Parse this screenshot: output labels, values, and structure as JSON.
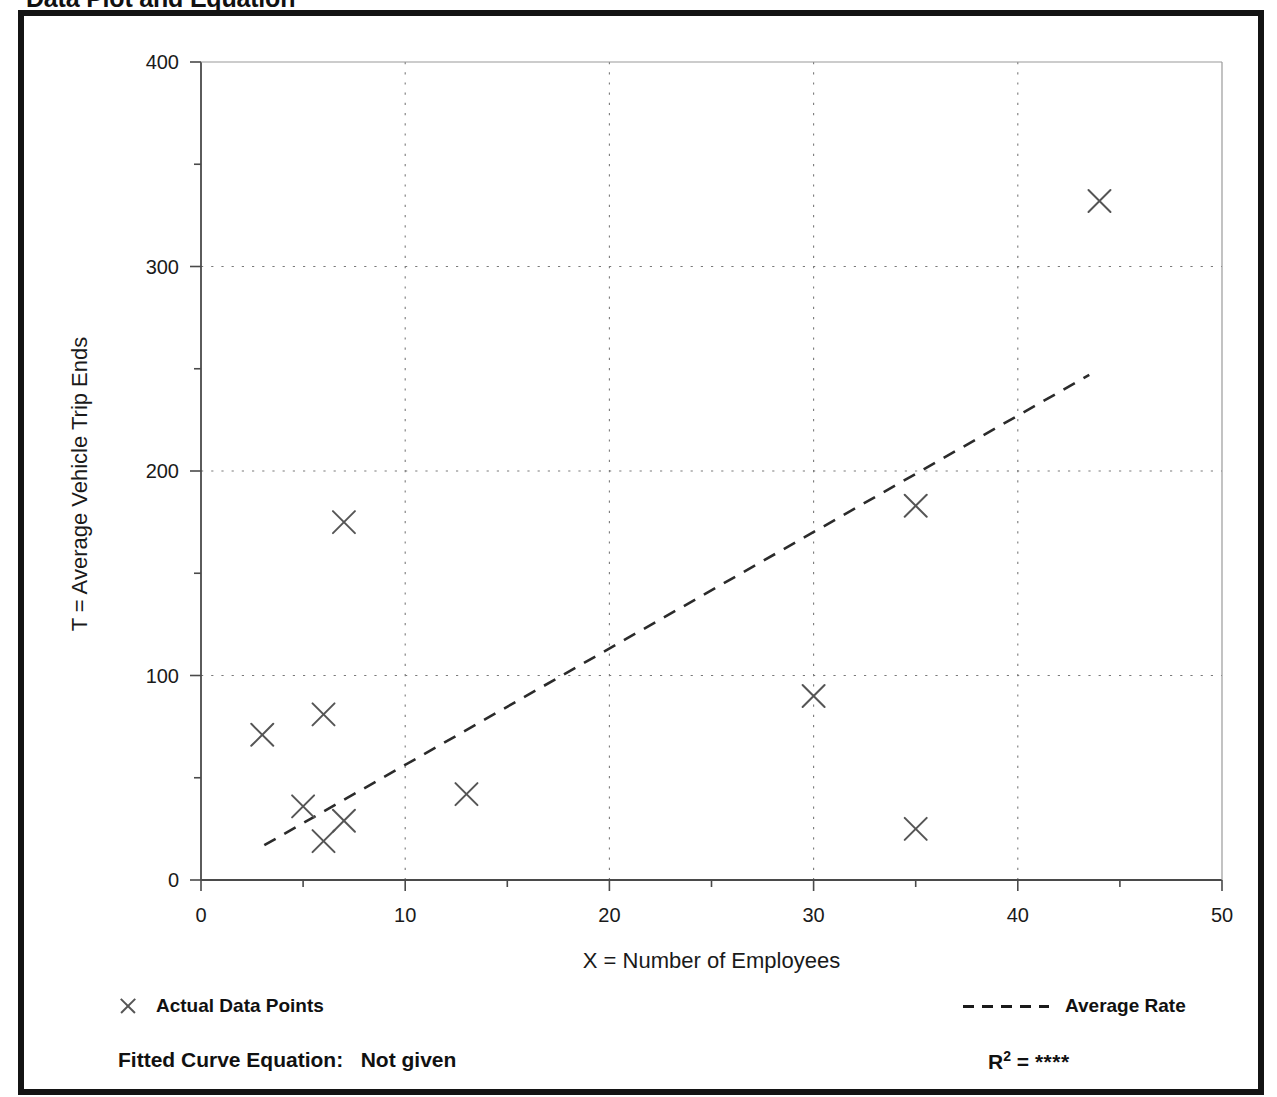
{
  "page": {
    "title": "Data Plot and Equation",
    "background_color": "#ffffff",
    "frame_color": "#141414"
  },
  "chart_data": {
    "type": "scatter",
    "title": "Data Plot and Equation",
    "xlabel": "X = Number of Employees",
    "ylabel": "T = Average Vehicle Trip Ends",
    "xlim": [
      0,
      50
    ],
    "ylim": [
      0,
      400
    ],
    "x_major_ticks": [
      0,
      10,
      20,
      30,
      40,
      50
    ],
    "x_minor_ticks": [
      5,
      15,
      25,
      35,
      45
    ],
    "y_major_ticks": [
      0,
      100,
      200,
      300,
      400
    ],
    "y_minor_ticks": [
      50,
      150,
      250,
      350
    ],
    "x_tick_labels": [
      "0",
      "10",
      "20",
      "30",
      "40",
      "50"
    ],
    "y_tick_labels": [
      "0",
      "100",
      "200",
      "300",
      "400"
    ],
    "grid": "dotted-major-both",
    "legend_position": "below-axes",
    "series": [
      {
        "name": "Actual Data Points",
        "type": "scatter",
        "marker": "x",
        "color": "#555555",
        "points": [
          {
            "x": 3,
            "y": 71
          },
          {
            "x": 5,
            "y": 36
          },
          {
            "x": 6,
            "y": 81
          },
          {
            "x": 6,
            "y": 19
          },
          {
            "x": 7,
            "y": 175
          },
          {
            "x": 7,
            "y": 29
          },
          {
            "x": 13,
            "y": 42
          },
          {
            "x": 30,
            "y": 90
          },
          {
            "x": 35,
            "y": 183
          },
          {
            "x": 35,
            "y": 25
          },
          {
            "x": 44,
            "y": 332
          }
        ]
      },
      {
        "name": "Average Rate",
        "type": "line",
        "style": "dashed",
        "color": "#2b2b2b",
        "endpoints": [
          {
            "x": 3.1,
            "y": 17
          },
          {
            "x": 43.5,
            "y": 247
          }
        ]
      }
    ],
    "annotations": {
      "equation_label": "Fitted Curve Equation:",
      "equation_value": "Not given",
      "r_squared_label": "R",
      "r_squared_exponent": "2",
      "r_squared_equals": "=",
      "r_squared_value": "****"
    }
  },
  "legend": {
    "data_points_label": "Actual Data Points",
    "average_rate_label": "Average Rate"
  }
}
